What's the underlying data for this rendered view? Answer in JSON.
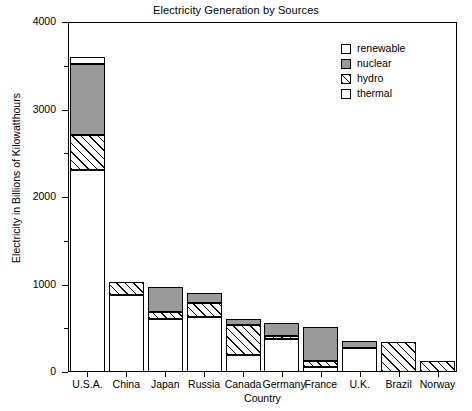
{
  "chart_data": {
    "type": "bar",
    "stacked": true,
    "title": "Electricity Generation by Sources",
    "xlabel": "Country",
    "ylabel": "Electricity in Billions of Kilowatthours",
    "categories": [
      "U.S.A.",
      "China",
      "Japan",
      "Russia",
      "Canada",
      "Germany",
      "France",
      "U.K.",
      "Brazil",
      "Norway"
    ],
    "ylim": [
      0,
      4000
    ],
    "ytick_labels": [
      "0",
      "1000",
      "2000",
      "3000",
      "4000"
    ],
    "ytick_values": [
      0,
      1000,
      2000,
      3000,
      4000
    ],
    "yminor_values": [
      500,
      1500,
      2500,
      3500
    ],
    "grid": false,
    "legend_position": "upper right",
    "series": [
      {
        "name": "thermal",
        "fill": "white",
        "values": [
          2310,
          880,
          610,
          630,
          200,
          380,
          60,
          270,
          0,
          0
        ]
      },
      {
        "name": "hydro",
        "fill": "hatched",
        "values": [
          400,
          150,
          80,
          160,
          340,
          30,
          70,
          0,
          340,
          130
        ]
      },
      {
        "name": "nuclear",
        "fill": "gray",
        "values": [
          810,
          0,
          280,
          110,
          70,
          150,
          390,
          90,
          0,
          0
        ]
      },
      {
        "name": "renewable",
        "fill": "white",
        "values": [
          80,
          0,
          0,
          0,
          0,
          0,
          0,
          0,
          0,
          0
        ]
      }
    ],
    "totals": [
      3600,
      1030,
      970,
      900,
      610,
      560,
      520,
      360,
      340,
      130
    ]
  },
  "legend": {
    "entries": [
      {
        "label": "renewable",
        "swatch": "renewable"
      },
      {
        "label": "nuclear",
        "swatch": "nuclear"
      },
      {
        "label": "hydro",
        "swatch": "hydro"
      },
      {
        "label": "thermal",
        "swatch": "thermal"
      }
    ]
  },
  "colors": {
    "nuclear": "#9a9a9a",
    "thermal": "#ffffff",
    "renewable": "#ffffff",
    "hydro_line": "#000000",
    "axis": "#000000"
  }
}
